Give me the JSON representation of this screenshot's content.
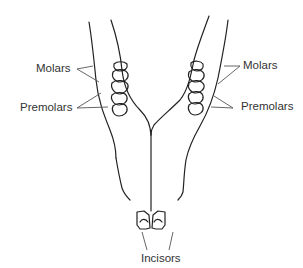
{
  "diagram": {
    "labels": {
      "left_molars": "Molars",
      "left_premolars": "Premolars",
      "right_molars": "Molars",
      "right_premolars": "Premolars",
      "incisors": "Incisors"
    },
    "colors": {
      "stroke": "#222222",
      "leader": "#555555",
      "text": "#333333",
      "background": "#ffffff"
    }
  }
}
